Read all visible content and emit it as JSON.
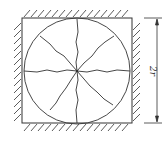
{
  "diagram": {
    "type": "mechanical-schematic",
    "colors": {
      "stroke": "#333333",
      "background": "#ffffff"
    },
    "square": {
      "x": 22,
      "y": 18,
      "size": 110
    },
    "circle": {
      "cx": 77,
      "cy": 71,
      "r": 53
    },
    "radial_cracks": 8,
    "hatched_walls": [
      "top",
      "left",
      "right",
      "bottom"
    ],
    "dimension": {
      "label": "2r",
      "orientation": "vertical",
      "x": 157,
      "y1": 18,
      "y2": 123
    }
  }
}
